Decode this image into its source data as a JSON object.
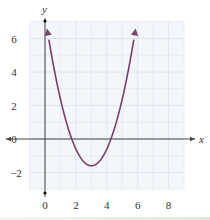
{
  "chart_data": {
    "type": "line",
    "title": "",
    "xlabel": "x",
    "ylabel": "y",
    "xlim": [
      -1,
      9
    ],
    "ylim": [
      -3,
      7
    ],
    "x_ticks": [
      0,
      2,
      4,
      6,
      8
    ],
    "y_ticks": [
      -2,
      0,
      2,
      4,
      6
    ],
    "x_tick_labels": [
      "0",
      "2",
      "4",
      "6",
      "8"
    ],
    "y_tick_labels": [
      "−2",
      "0",
      "2",
      "4",
      "6"
    ],
    "grid": true,
    "grid_step": 1,
    "legend": null,
    "series": [
      {
        "name": "parabola",
        "equation": "y = (x − 3)² − 1.6",
        "color": "#7b3f6b",
        "arrows_at_ends": true,
        "x": [
          0.13,
          0.5,
          1,
          1.5,
          2,
          2.5,
          3,
          3.5,
          4,
          4.5,
          5,
          5.5,
          5.87
        ],
        "y": [
          6.6,
          4.65,
          2.4,
          0.65,
          -0.6,
          -1.35,
          -1.6,
          -1.35,
          -0.6,
          0.65,
          2.4,
          4.65,
          6.6
        ]
      }
    ],
    "key_points": {
      "vertex": [
        3,
        -1.6
      ],
      "x_intercepts": [
        1.74,
        4.26
      ]
    }
  },
  "colors": {
    "curve": "#7b3f6b",
    "grid": "#dfe6ee",
    "grid_bg": "#f3f7fb",
    "axis": "#444444"
  }
}
